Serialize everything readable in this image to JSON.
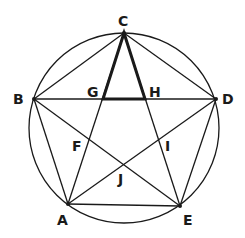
{
  "diagram": {
    "type": "geometry",
    "stroke_color": "#1a1a1a",
    "circle": {
      "cx": 124,
      "cy": 128,
      "r": 95
    },
    "points": {
      "A": {
        "x": 68,
        "y": 204,
        "label": "A",
        "lx": 57,
        "ly": 225
      },
      "B": {
        "x": 34,
        "y": 99,
        "label": "B",
        "lx": 13,
        "ly": 104
      },
      "C": {
        "x": 124,
        "y": 33,
        "label": "C",
        "lx": 118,
        "ly": 26
      },
      "D": {
        "x": 216,
        "y": 99,
        "label": "D",
        "lx": 222,
        "ly": 104
      },
      "E": {
        "x": 180,
        "y": 206,
        "label": "E",
        "lx": 183,
        "ly": 225
      },
      "F": {
        "x": 89,
        "y": 140,
        "label": "F",
        "lx": 72,
        "ly": 151
      },
      "G": {
        "x": 103,
        "y": 99,
        "label": "G",
        "lx": 87,
        "ly": 97
      },
      "H": {
        "x": 145,
        "y": 99,
        "label": "H",
        "lx": 149,
        "ly": 97
      },
      "I": {
        "x": 160,
        "y": 140,
        "label": "I",
        "lx": 165,
        "ly": 151
      },
      "J": {
        "x": 124,
        "y": 165,
        "label": "J",
        "lx": 118,
        "ly": 184
      }
    },
    "pentagon_edges": [
      [
        "A",
        "B"
      ],
      [
        "B",
        "C"
      ],
      [
        "C",
        "D"
      ],
      [
        "D",
        "E"
      ],
      [
        "E",
        "A"
      ]
    ],
    "star_edges": [
      [
        "A",
        "C"
      ],
      [
        "C",
        "E"
      ],
      [
        "E",
        "B"
      ],
      [
        "B",
        "D"
      ],
      [
        "D",
        "A"
      ]
    ],
    "highlighted_triangle": [
      "C",
      "G",
      "H"
    ]
  }
}
